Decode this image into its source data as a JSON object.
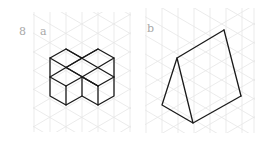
{
  "figure": {
    "number": "8",
    "panels": [
      {
        "label": "a",
        "shape": "isometric-cube-stack",
        "description": "Five-cube arrangement drawn on isometric grid"
      },
      {
        "label": "b",
        "shape": "isometric-triangular-prism",
        "description": "Triangular prism drawn on isometric grid"
      }
    ]
  },
  "colors": {
    "grid": "#e4e4e4",
    "stroke": "#1a1a1a",
    "label": "#a8a8a8",
    "background": "#ffffff"
  }
}
